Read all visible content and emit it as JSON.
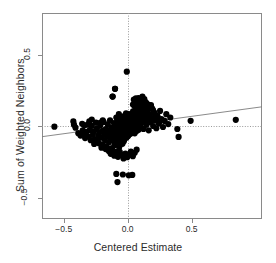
{
  "chart_data": {
    "type": "scatter",
    "title": "",
    "xlabel": "Centered Estimate",
    "ylabel": "Sum of Weighted Neighbors",
    "xlim": [
      -0.67,
      1.05
    ],
    "ylim": [
      -0.645,
      0.79
    ],
    "xticks": [
      -0.5,
      0.0,
      0.5
    ],
    "xtick_labels": [
      "-0.5",
      "0.0",
      "0.5"
    ],
    "yticks": [
      0.5,
      0.0,
      -0.5
    ],
    "ytick_labels": [
      "0.5",
      "0.0",
      "-0.5"
    ],
    "grid": false,
    "legend": null,
    "marker": "filled-circle",
    "marker_color": "#000000",
    "marker_size": 4.2,
    "frame_color": "#8a8a8a",
    "reference_lines": [
      {
        "name": "vertical-zero-line",
        "orientation": "vertical",
        "value": 0.0,
        "style": "dotted",
        "color": "#9a9a9a"
      },
      {
        "name": "horizontal-zero-line",
        "orientation": "horizontal",
        "value": 0.0,
        "style": "dotted",
        "color": "#9a9a9a"
      }
    ],
    "fit_line": {
      "name": "regression-line",
      "type": "linear",
      "slope": 0.121,
      "intercept": 0.0095,
      "color": "#7d7d7d",
      "x_start": -0.67,
      "x_end": 1.05
    },
    "points": [
      [
        -0.573,
        -0.002
      ],
      [
        -0.425,
        0.035
      ],
      [
        -0.408,
        -0.009
      ],
      [
        -0.386,
        -0.047
      ],
      [
        -0.369,
        -0.064
      ],
      [
        -0.356,
        0.018
      ],
      [
        -0.341,
        -0.053
      ],
      [
        -0.333,
        -0.081
      ],
      [
        -0.322,
        -0.038
      ],
      [
        -0.312,
        0.012
      ],
      [
        -0.305,
        -0.071
      ],
      [
        -0.297,
        -0.026
      ],
      [
        -0.289,
        -0.096
      ],
      [
        -0.281,
        0.004
      ],
      [
        -0.272,
        -0.058
      ],
      [
        -0.264,
        -0.034
      ],
      [
        -0.257,
        -0.088
      ],
      [
        -0.248,
        0.026
      ],
      [
        -0.241,
        -0.014
      ],
      [
        -0.235,
        -0.103
      ],
      [
        -0.228,
        -0.062
      ],
      [
        -0.221,
        -0.041
      ],
      [
        -0.214,
        0.006
      ],
      [
        -0.208,
        -0.079
      ],
      [
        -0.201,
        -0.126
      ],
      [
        -0.195,
        -0.031
      ],
      [
        -0.189,
        0.031
      ],
      [
        -0.183,
        -0.055
      ],
      [
        -0.178,
        -0.095
      ],
      [
        -0.172,
        -0.018
      ],
      [
        -0.167,
        -0.141
      ],
      [
        -0.161,
        -0.068
      ],
      [
        -0.156,
        0.015
      ],
      [
        -0.151,
        -0.044
      ],
      [
        -0.147,
        -0.111
      ],
      [
        -0.142,
        -0.025
      ],
      [
        -0.138,
        0.042
      ],
      [
        -0.134,
        -0.083
      ],
      [
        -0.129,
        -0.152
      ],
      [
        -0.125,
        -0.009
      ],
      [
        -0.121,
        -0.059
      ],
      [
        -0.118,
        0.208
      ],
      [
        -0.114,
        -0.037
      ],
      [
        -0.111,
        -0.098
      ],
      [
        -0.107,
        0.023
      ],
      [
        -0.104,
        -0.132
      ],
      [
        -0.101,
        -0.071
      ],
      [
        -0.098,
        0.008
      ],
      [
        -0.095,
        -0.048
      ],
      [
        -0.092,
        -0.178
      ],
      [
        -0.089,
        0.062
      ],
      [
        -0.086,
        -0.022
      ],
      [
        -0.084,
        -0.114
      ],
      [
        -0.099,
        0.262
      ],
      [
        -0.081,
        0.035
      ],
      [
        -0.078,
        -0.061
      ],
      [
        -0.076,
        -0.089
      ],
      [
        -0.073,
        0.011
      ],
      [
        -0.071,
        -0.039
      ],
      [
        -0.069,
        0.085
      ],
      [
        -0.067,
        -0.146
      ],
      [
        -0.065,
        -0.016
      ],
      [
        -0.063,
        0.048
      ],
      [
        -0.061,
        -0.073
      ],
      [
        -0.059,
        -0.108
      ],
      [
        -0.057,
        0.021
      ],
      [
        -0.089,
        -0.331
      ],
      [
        -0.055,
        -0.045
      ],
      [
        -0.053,
        0.068
      ],
      [
        -0.051,
        -0.028
      ],
      [
        -0.049,
        -0.091
      ],
      [
        -0.048,
        0.004
      ],
      [
        -0.046,
        -0.057
      ],
      [
        -0.044,
        0.038
      ],
      [
        -0.043,
        -0.013
      ],
      [
        -0.041,
        -0.121
      ],
      [
        -0.08,
        -0.388
      ],
      [
        -0.04,
        0.052
      ],
      [
        -0.038,
        -0.036
      ],
      [
        -0.037,
        -0.078
      ],
      [
        -0.035,
        0.016
      ],
      [
        -0.034,
        -0.065
      ],
      [
        -0.033,
        0.029
      ],
      [
        -0.031,
        -0.005
      ],
      [
        -0.03,
        -0.103
      ],
      [
        -0.029,
        0.044
      ],
      [
        -0.028,
        -0.049
      ],
      [
        -0.026,
        0.009
      ],
      [
        -0.025,
        -0.031
      ],
      [
        -0.024,
        0.074
      ],
      [
        -0.023,
        -0.086
      ],
      [
        -0.022,
        0.002
      ],
      [
        -0.021,
        -0.058
      ],
      [
        -0.02,
        0.033
      ],
      [
        -0.019,
        -0.017
      ],
      [
        -0.018,
        0.058
      ],
      [
        -0.017,
        -0.042
      ],
      [
        -0.016,
        0.014
      ],
      [
        -0.015,
        -0.069
      ],
      [
        -0.014,
        0.041
      ],
      [
        -0.014,
        -0.024
      ],
      [
        -0.013,
        0.091
      ],
      [
        -0.012,
        -0.008
      ],
      [
        -0.011,
        -0.052
      ],
      [
        -0.011,
        0.025
      ],
      [
        -0.01,
        -0.035
      ],
      [
        -0.009,
        0.006
      ],
      [
        -0.009,
        0.063
      ],
      [
        -0.008,
        -0.078
      ],
      [
        -0.008,
        -0.019
      ],
      [
        -0.007,
        0.048
      ],
      [
        -0.006,
        -0.044
      ],
      [
        -0.006,
        0.018
      ],
      [
        -0.005,
        -0.011
      ],
      [
        -0.005,
        0.079
      ],
      [
        -0.004,
        -0.06
      ],
      [
        -0.004,
        0.03
      ],
      [
        -0.003,
        -0.027
      ],
      [
        -0.003,
        0.003
      ],
      [
        -0.002,
        0.055
      ],
      [
        -0.002,
        -0.038
      ],
      [
        -0.001,
        0.021
      ],
      [
        -0.001,
        -0.015
      ],
      [
        0.0,
        0.068
      ],
      [
        0.0,
        -0.05
      ],
      [
        0.0,
        0.009
      ],
      [
        0.001,
        0.036
      ],
      [
        0.001,
        -0.023
      ],
      [
        0.002,
        0.001
      ],
      [
        0.002,
        0.085
      ],
      [
        0.003,
        -0.066
      ],
      [
        0.003,
        0.027
      ],
      [
        0.004,
        -0.009
      ],
      [
        0.004,
        0.051
      ],
      [
        0.005,
        -0.033
      ],
      [
        0.005,
        0.013
      ],
      [
        0.006,
        0.072
      ],
      [
        0.006,
        -0.046
      ],
      [
        0.007,
        0.005
      ],
      [
        0.008,
        0.04
      ],
      [
        0.008,
        -0.019
      ],
      [
        0.009,
        0.023
      ],
      [
        0.01,
        -0.056
      ],
      [
        0.01,
        0.06
      ],
      [
        0.011,
        -0.004
      ],
      [
        0.012,
        0.033
      ],
      [
        0.013,
        -0.029
      ],
      [
        0.013,
        0.011
      ],
      [
        0.014,
        0.078
      ],
      [
        0.015,
        -0.041
      ],
      [
        0.016,
        0.018
      ],
      [
        0.017,
        -0.012
      ],
      [
        0.018,
        0.046
      ],
      [
        0.019,
        -0.024
      ],
      [
        0.02,
        0.007
      ],
      [
        0.021,
        0.065
      ],
      [
        0.022,
        -0.051
      ],
      [
        0.023,
        0.029
      ],
      [
        0.024,
        -0.006
      ],
      [
        0.025,
        0.038
      ],
      [
        0.026,
        -0.035
      ],
      [
        0.027,
        0.015
      ],
      [
        0.028,
        0.088
      ],
      [
        0.029,
        -0.017
      ],
      [
        0.031,
        0.053
      ],
      [
        0.032,
        -0.044
      ],
      [
        0.033,
        0.022
      ],
      [
        0.035,
        0.002
      ],
      [
        0.036,
        0.07
      ],
      [
        0.037,
        -0.027
      ],
      [
        0.039,
        0.035
      ],
      [
        0.04,
        -0.01
      ],
      [
        0.042,
        0.105
      ],
      [
        0.043,
        0.046
      ],
      [
        0.045,
        -0.037
      ],
      [
        0.046,
        0.016
      ],
      [
        0.048,
        0.082
      ],
      [
        0.05,
        -0.021
      ],
      [
        0.051,
        0.059
      ],
      [
        0.053,
        0.027
      ],
      [
        0.055,
        -0.048
      ],
      [
        0.057,
        0.008
      ],
      [
        0.059,
        0.096
      ],
      [
        0.061,
        0.041
      ],
      [
        0.063,
        -0.014
      ],
      [
        0.065,
        0.068
      ],
      [
        0.067,
        0.02
      ],
      [
        0.07,
        0.118
      ],
      [
        0.072,
        -0.031
      ],
      [
        0.074,
        0.053
      ],
      [
        0.077,
        0.005
      ],
      [
        0.079,
        0.088
      ],
      [
        0.082,
        0.033
      ],
      [
        0.085,
        -0.023
      ],
      [
        0.088,
        0.132
      ],
      [
        0.091,
        0.061
      ],
      [
        0.094,
        0.014
      ],
      [
        0.097,
        0.101
      ],
      [
        0.1,
        0.044
      ],
      [
        0.104,
        -0.008
      ],
      [
        0.107,
        0.076
      ],
      [
        0.111,
        0.025
      ],
      [
        0.115,
        0.119
      ],
      [
        0.119,
        0.055
      ],
      [
        0.123,
        -0.018
      ],
      [
        0.128,
        0.091
      ],
      [
        0.132,
        0.036
      ],
      [
        0.137,
        0.146
      ],
      [
        0.142,
        0.068
      ],
      [
        0.147,
        0.011
      ],
      [
        0.153,
        0.105
      ],
      [
        0.158,
        0.048
      ],
      [
        0.164,
        -0.027
      ],
      [
        0.171,
        0.082
      ],
      [
        0.177,
        0.029
      ],
      [
        0.184,
        0.128
      ],
      [
        0.191,
        0.058
      ],
      [
        0.199,
        0.003
      ],
      [
        0.207,
        0.095
      ],
      [
        0.215,
        0.041
      ],
      [
        0.224,
        -0.013
      ],
      [
        0.233,
        0.072
      ],
      [
        0.243,
        0.021
      ],
      [
        0.253,
        0.108
      ],
      [
        0.264,
        0.051
      ],
      [
        0.276,
        -0.004
      ],
      [
        0.289,
        0.038
      ],
      [
        0.302,
        0.085
      ],
      [
        0.317,
        0.016
      ],
      [
        0.333,
        0.062
      ],
      [
        0.388,
        -0.018
      ],
      [
        0.398,
        -0.073
      ],
      [
        0.492,
        0.039
      ],
      [
        0.845,
        0.046
      ],
      [
        0.041,
        0.152
      ],
      [
        0.056,
        0.138
      ],
      [
        0.071,
        0.165
      ],
      [
        0.086,
        0.144
      ],
      [
        0.102,
        0.158
      ],
      [
        0.118,
        0.136
      ],
      [
        0.134,
        0.172
      ],
      [
        0.15,
        0.141
      ],
      [
        0.166,
        0.126
      ],
      [
        0.182,
        0.149
      ],
      [
        0.198,
        0.113
      ],
      [
        0.048,
        0.186
      ],
      [
        0.064,
        0.196
      ],
      [
        0.08,
        0.178
      ],
      [
        0.095,
        0.168
      ],
      [
        0.11,
        0.19
      ],
      [
        -0.007,
        0.381
      ],
      [
        -0.118,
        0.208
      ],
      [
        -0.099,
        0.262
      ],
      [
        -0.148,
        -0.172
      ],
      [
        -0.133,
        -0.191
      ],
      [
        -0.119,
        -0.166
      ],
      [
        -0.105,
        -0.204
      ],
      [
        -0.09,
        -0.183
      ],
      [
        -0.076,
        -0.212
      ],
      [
        -0.062,
        -0.178
      ],
      [
        -0.047,
        -0.198
      ],
      [
        -0.033,
        -0.223
      ],
      [
        -0.018,
        -0.189
      ],
      [
        -0.004,
        -0.215
      ],
      [
        0.01,
        -0.196
      ],
      [
        0.025,
        -0.176
      ],
      [
        0.04,
        -0.208
      ],
      [
        0.055,
        -0.184
      ],
      [
        0.07,
        -0.162
      ],
      [
        -0.038,
        -0.335
      ],
      [
        0.008,
        -0.341
      ],
      [
        0.036,
        -0.338
      ],
      [
        -0.205,
        -0.148
      ],
      [
        -0.188,
        -0.136
      ],
      [
        -0.172,
        -0.158
      ],
      [
        -0.225,
        -0.118
      ],
      [
        -0.245,
        -0.101
      ],
      [
        -0.262,
        -0.122
      ],
      [
        -0.195,
        0.042
      ],
      [
        -0.212,
        0.026
      ],
      [
        0.085,
        0.198
      ],
      [
        0.1,
        0.182
      ],
      [
        0.115,
        0.208
      ],
      [
        0.13,
        0.19
      ],
      [
        0.145,
        0.164
      ],
      [
        0.16,
        0.152
      ],
      [
        0.175,
        0.138
      ],
      [
        0.19,
        0.126
      ],
      [
        0.205,
        0.098
      ],
      [
        0.22,
        0.078
      ],
      [
        0.235,
        0.058
      ],
      [
        0.25,
        0.032
      ],
      [
        -0.3,
        0.036
      ],
      [
        -0.281,
        0.048
      ],
      [
        -0.338,
        0.008
      ],
      [
        -0.352,
        -0.028
      ],
      [
        -0.42,
        0.012
      ]
    ]
  }
}
